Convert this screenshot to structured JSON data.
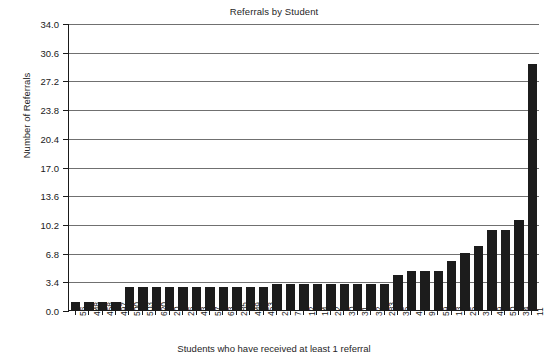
{
  "chart_data": {
    "type": "bar",
    "title": "Referrals by Student",
    "xlabel": "Students who have received at least 1 referral",
    "ylabel": "Number of Referrals",
    "categories": [
      "56",
      "448",
      "458",
      "497",
      "500",
      "503",
      "620",
      "20",
      "26",
      "43",
      "57",
      "63",
      "285",
      "449",
      "453",
      "2",
      "7",
      "12",
      "14",
      "22",
      "30",
      "31",
      "32",
      "283",
      "35",
      "4",
      "9",
      "59",
      "13",
      "25",
      "3",
      "49",
      "50",
      "34",
      "11"
    ],
    "values": [
      1,
      1,
      1,
      1,
      2.7,
      2.7,
      2.7,
      2.7,
      2.7,
      2.7,
      2.7,
      2.7,
      2.7,
      2.7,
      2.7,
      3.1,
      3.1,
      3.1,
      3.1,
      3.1,
      3.1,
      3.1,
      3.1,
      3.1,
      4.1,
      4.6,
      4.6,
      4.6,
      5.8,
      6.8,
      7.6,
      9.5,
      9.5,
      10.7,
      29.1
    ],
    "yticks": [
      0.0,
      3.4,
      6.8,
      10.2,
      13.6,
      17.0,
      20.4,
      23.8,
      27.2,
      30.6,
      34.0
    ],
    "ytick_labels": [
      "0.0",
      "3.4",
      "6.8",
      "10.2",
      "13.6",
      "17.0",
      "20.4",
      "23.8",
      "27.2",
      "30.6",
      "34.0"
    ],
    "ylim": [
      0,
      34.0
    ],
    "grid": true,
    "legend": null,
    "bar_color": "#1c1c1c",
    "grid_color": "#707070",
    "axis_color": "#1a1a1a",
    "background": "#ffffff"
  }
}
